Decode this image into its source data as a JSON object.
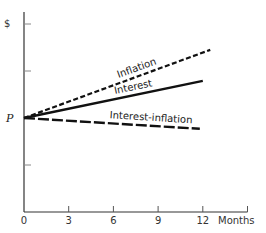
{
  "chart_data": {
    "type": "line",
    "title": "",
    "xlabel": "Months",
    "ylabel": "$",
    "y_origin_label": "P",
    "x_ticks": [
      0,
      3,
      6,
      9,
      12,
      15
    ],
    "x_tick_labels": [
      "0",
      "3",
      "6",
      "9",
      "12",
      ""
    ],
    "y_ticks_relative_to_P": [
      -2,
      -1,
      0,
      1,
      2
    ],
    "xlim": [
      0,
      15
    ],
    "ylim_relative_to_P": [
      -2,
      2.2
    ],
    "grid": false,
    "legend": "none (inline labels)",
    "series": [
      {
        "name": "Inflation",
        "style": "short-dash",
        "x": [
          0,
          12.5
        ],
        "values": [
          0,
          1.45
        ]
      },
      {
        "name": "Interest",
        "style": "solid",
        "x": [
          0,
          12
        ],
        "values": [
          0,
          0.79
        ]
      },
      {
        "name": "Interest-inflation",
        "style": "long-dash",
        "x": [
          0,
          11.8
        ],
        "values": [
          0,
          -0.23
        ]
      }
    ],
    "annotations": [
      {
        "text": "Inflation",
        "series": "Inflation"
      },
      {
        "text": "Interest",
        "series": "Interest"
      },
      {
        "text": "Interest-inflation",
        "series": "Interest-inflation"
      }
    ]
  }
}
